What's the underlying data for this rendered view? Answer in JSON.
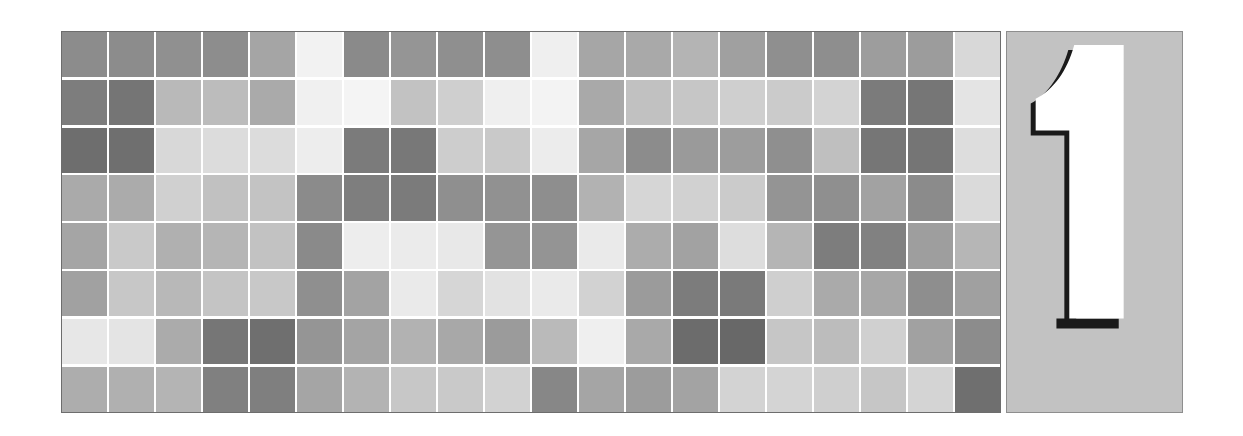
{
  "figure": {
    "title": "",
    "background_color": "#ffffff",
    "panel_label": "1",
    "panel_label_color": "#ffffff",
    "panel_label_outline_color": "#1a1a1a",
    "panel_background_color": "#c2c2c2",
    "panel_border_color": "#8e8e8e",
    "heatmap_border_color": "#6d6d6d",
    "gap_color": "#ffffff"
  },
  "chart_data": {
    "type": "heatmap",
    "title": "",
    "xlabel": "",
    "ylabel": "",
    "rows": 8,
    "cols": 20,
    "grid": true,
    "legend": "none",
    "colormap": "greys",
    "value_range": [
      0,
      1
    ],
    "cell_colors": [
      [
        "#8c8c8c",
        "#8c8c8c",
        "#909090",
        "#8d8d8d",
        "#a5a5a5",
        "#f2f2f2",
        "#8a8a8a",
        "#959595",
        "#8f8f8f",
        "#8e8e8e",
        "#efefef",
        "#a6a6a6",
        "#a9a9a9",
        "#b4b4b4",
        "#a0a0a0",
        "#8f8f8f",
        "#8e8e8e",
        "#9d9d9d",
        "#9c9c9c",
        "#d8d8d8"
      ],
      [
        "#7d7d7d",
        "#757575",
        "#b9b9b9",
        "#bcbcbc",
        "#aaaaaa",
        "#f0f0f0",
        "#f4f4f4",
        "#c2c2c2",
        "#cfcfcf",
        "#efefef",
        "#f3f3f3",
        "#a9a9a9",
        "#c1c1c1",
        "#c6c6c6",
        "#cfcfcf",
        "#cbcbcb",
        "#d3d3d3",
        "#7b7b7b",
        "#767676",
        "#e4e4e4"
      ],
      [
        "#6e6e6e",
        "#6f6f6f",
        "#d8d8d8",
        "#dcdcdc",
        "#dcdcdc",
        "#ededed",
        "#7b7b7b",
        "#787878",
        "#cdcdcd",
        "#c9c9c9",
        "#ececec",
        "#a6a6a6",
        "#8c8c8c",
        "#9a9a9a",
        "#9d9d9d",
        "#8f8f8f",
        "#bfbfbf",
        "#767676",
        "#757575",
        "#dddddd"
      ],
      [
        "#aaaaaa",
        "#ababab",
        "#d0d0d0",
        "#c1c1c1",
        "#c3c3c3",
        "#8b8b8b",
        "#7e7e7e",
        "#7b7b7b",
        "#8f8f8f",
        "#919191",
        "#8e8e8e",
        "#b2b2b2",
        "#d6d6d6",
        "#d1d1d1",
        "#cbcbcb",
        "#949494",
        "#8f8f8f",
        "#a2a2a2",
        "#8b8b8b",
        "#dadada"
      ],
      [
        "#a5a5a5",
        "#c9c9c9",
        "#b0b0b0",
        "#b5b5b5",
        "#c2c2c2",
        "#8a8a8a",
        "#ededed",
        "#ebebeb",
        "#e8e8e8",
        "#959595",
        "#949494",
        "#eaeaea",
        "#acacac",
        "#a2a2a2",
        "#dddddd",
        "#b5b5b5",
        "#7d7d7d",
        "#818181",
        "#9e9e9e",
        "#b6b6b6"
      ],
      [
        "#a1a1a1",
        "#c7c7c7",
        "#b8b8b8",
        "#c4c4c4",
        "#c8c8c8",
        "#8f8f8f",
        "#a3a3a3",
        "#eaeaea",
        "#d6d6d6",
        "#e2e2e2",
        "#eaeaea",
        "#d2d2d2",
        "#9b9b9b",
        "#7c7c7c",
        "#7a7a7a",
        "#cfcfcf",
        "#aaaaaa",
        "#a7a7a7",
        "#8e8e8e",
        "#a0a0a0"
      ],
      [
        "#e7e7e7",
        "#e4e4e4",
        "#ababab",
        "#767676",
        "#6f6f6f",
        "#959595",
        "#a4a4a4",
        "#b2b2b2",
        "#a8a8a8",
        "#9b9b9b",
        "#bababa",
        "#efefef",
        "#a9a9a9",
        "#6c6c6c",
        "#686868",
        "#c6c6c6",
        "#bcbcbc",
        "#d0d0d0",
        "#a1a1a1",
        "#8c8c8c"
      ],
      [
        "#adadad",
        "#b0b0b0",
        "#b4b4b4",
        "#808080",
        "#7f7f7f",
        "#a5a5a5",
        "#b3b3b3",
        "#c7c7c7",
        "#c9c9c9",
        "#d2d2d2",
        "#878787",
        "#a5a5a5",
        "#9c9c9c",
        "#a3a3a3",
        "#d3d3d3",
        "#d4d4d4",
        "#cfcfcf",
        "#c6c6c6",
        "#d4d4d4",
        "#6f6f6f"
      ]
    ],
    "values": [
      [
        0.45,
        0.45,
        0.44,
        0.45,
        0.35,
        0.05,
        0.46,
        0.42,
        0.44,
        0.44,
        0.06,
        0.35,
        0.34,
        0.29,
        0.38,
        0.44,
        0.44,
        0.39,
        0.39,
        0.15
      ],
      [
        0.51,
        0.54,
        0.27,
        0.26,
        0.33,
        0.06,
        0.04,
        0.24,
        0.19,
        0.06,
        0.05,
        0.34,
        0.24,
        0.22,
        0.19,
        0.21,
        0.17,
        0.52,
        0.54,
        0.11
      ],
      [
        0.57,
        0.56,
        0.15,
        0.14,
        0.14,
        0.07,
        0.52,
        0.53,
        0.2,
        0.21,
        0.07,
        0.35,
        0.45,
        0.4,
        0.38,
        0.44,
        0.25,
        0.54,
        0.54,
        0.13
      ],
      [
        0.33,
        0.33,
        0.18,
        0.24,
        0.24,
        0.45,
        0.51,
        0.52,
        0.44,
        0.43,
        0.44,
        0.3,
        0.16,
        0.18,
        0.21,
        0.42,
        0.44,
        0.36,
        0.45,
        0.15
      ],
      [
        0.35,
        0.21,
        0.31,
        0.29,
        0.24,
        0.46,
        0.07,
        0.08,
        0.09,
        0.42,
        0.42,
        0.08,
        0.33,
        0.36,
        0.13,
        0.29,
        0.51,
        0.49,
        0.38,
        0.29
      ],
      [
        0.37,
        0.22,
        0.28,
        0.23,
        0.22,
        0.44,
        0.36,
        0.08,
        0.16,
        0.11,
        0.08,
        0.18,
        0.39,
        0.51,
        0.52,
        0.19,
        0.33,
        0.35,
        0.44,
        0.37
      ],
      [
        0.09,
        0.11,
        0.33,
        0.54,
        0.56,
        0.42,
        0.36,
        0.3,
        0.34,
        0.39,
        0.27,
        0.06,
        0.34,
        0.58,
        0.59,
        0.22,
        0.26,
        0.18,
        0.37,
        0.45
      ],
      [
        0.32,
        0.31,
        0.29,
        0.5,
        0.5,
        0.35,
        0.3,
        0.22,
        0.21,
        0.18,
        0.47,
        0.35,
        0.39,
        0.36,
        0.17,
        0.17,
        0.19,
        0.22,
        0.17,
        0.56
      ]
    ]
  }
}
